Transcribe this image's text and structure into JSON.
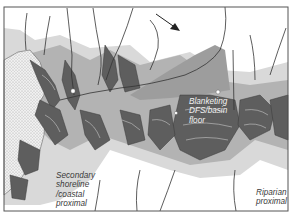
{
  "figure": {
    "type": "depositional-environment sketch map",
    "flow_arrow": "flow-direction-arrow",
    "labels": {
      "dfs": "Blanketing\nDFS/basin\nfloor",
      "secondary": "Secondary\nshoreline\n/coastal\nproximal",
      "riparian": "Riparian\nproximal"
    },
    "colors": {
      "frame": "#555555",
      "light_grey_zone": "#d6d6d6",
      "mid_grey_zone": "#a8a8a8",
      "dark_fan": "#5a5a5a",
      "stipple_basin": "#e8e8e8",
      "channel_line": "#333333"
    }
  }
}
